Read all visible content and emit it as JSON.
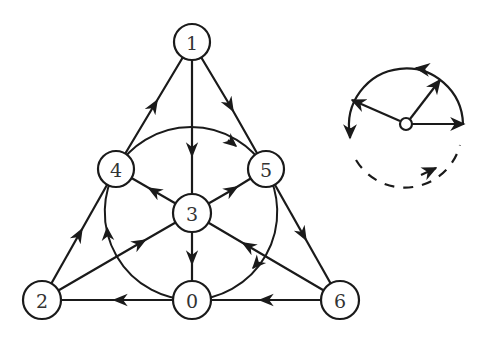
{
  "diagram": {
    "type": "directed-graph",
    "nodes": [
      {
        "id": "0",
        "label": "0",
        "x": 192,
        "y": 300
      },
      {
        "id": "1",
        "label": "1",
        "x": 192,
        "y": 42
      },
      {
        "id": "2",
        "label": "2",
        "x": 42,
        "y": 300
      },
      {
        "id": "3",
        "label": "3",
        "x": 192,
        "y": 213
      },
      {
        "id": "4",
        "label": "4",
        "x": 116,
        "y": 169
      },
      {
        "id": "5",
        "label": "5",
        "x": 266,
        "y": 169
      },
      {
        "id": "6",
        "label": "6",
        "x": 340,
        "y": 300
      }
    ],
    "straight_edges": [
      {
        "from": "4",
        "to": "1"
      },
      {
        "from": "1",
        "to": "5"
      },
      {
        "from": "1",
        "to": "3"
      },
      {
        "from": "2",
        "to": "4"
      },
      {
        "from": "5",
        "to": "6"
      },
      {
        "from": "6",
        "to": "0"
      },
      {
        "from": "0",
        "to": "2"
      },
      {
        "from": "3",
        "to": "4"
      },
      {
        "from": "3",
        "to": "5"
      },
      {
        "from": "3",
        "to": "0"
      },
      {
        "from": "2",
        "to": "3"
      },
      {
        "from": "6",
        "to": "3"
      }
    ],
    "circle_edges": [
      {
        "from": "4",
        "to": "5"
      },
      {
        "from": "5",
        "to": "0"
      },
      {
        "from": "0",
        "to": "4"
      }
    ],
    "legend": {
      "center": {
        "x": 406,
        "y": 124
      },
      "radius": 57,
      "description": "Orientation key: hub with three outgoing arrows; circle traversed counterclockwise, lower portion dashed"
    }
  }
}
